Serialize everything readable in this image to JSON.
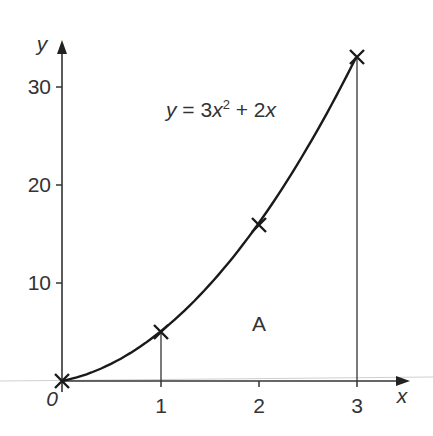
{
  "chart_data": {
    "type": "line",
    "title": "",
    "equation_label": "y = 3x² + 2x",
    "equation_parts": {
      "lhs": "y",
      "eq": " = 3",
      "x1": "x",
      "sup": "2",
      "plus": " + 2",
      "x2": "x"
    },
    "xlabel": "x",
    "ylabel": "y",
    "origin_label": "0",
    "x_ticks": [
      "1",
      "2",
      "3"
    ],
    "y_ticks": [
      "10",
      "20",
      "30"
    ],
    "xlim": [
      0,
      3.4
    ],
    "ylim": [
      0,
      34
    ],
    "grid": false,
    "series": [
      {
        "name": "y = 3x² + 2x",
        "x": [
          0,
          0.5,
          1,
          1.5,
          2,
          2.5,
          3
        ],
        "y": [
          0,
          1.75,
          5,
          9.75,
          16,
          23.75,
          33
        ]
      }
    ],
    "marked_points": [
      {
        "x": 0,
        "y": 0
      },
      {
        "x": 1,
        "y": 5
      },
      {
        "x": 2,
        "y": 16
      },
      {
        "x": 3,
        "y": 33
      }
    ],
    "vertical_lines_at_x": [
      1,
      3
    ],
    "region_label": "A"
  }
}
